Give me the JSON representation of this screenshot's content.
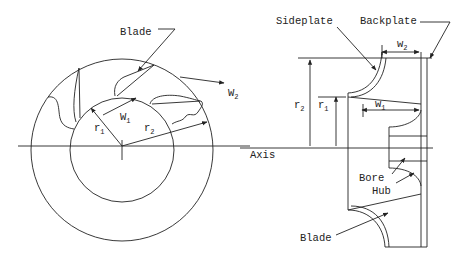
{
  "diagram": {
    "type": "impeller geometry (front view and cross-section)",
    "left_view": {
      "labels": {
        "blade": "Blade",
        "w1": "W",
        "w1_sub": "1",
        "w2": "W",
        "w2_sub": "2",
        "r1": "r",
        "r1_sub": "1",
        "r2": "r",
        "r2_sub": "2"
      }
    },
    "right_view": {
      "labels": {
        "sideplate": "Sideplate",
        "backplate": "Backplate",
        "w2": "w",
        "w2_sub": "2",
        "w1": "w",
        "w1_sub": "1",
        "r2": "r",
        "r2_sub": "2",
        "r1": "r",
        "r1_sub": "1",
        "axis": "Axis",
        "bore": "Bore",
        "hub": "Hub",
        "blade": "Blade"
      }
    }
  }
}
